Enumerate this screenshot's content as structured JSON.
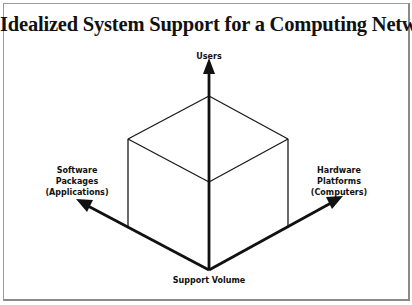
{
  "title": "Idealized System Support for a Computing Network",
  "axes": {
    "up": {
      "label": "Users"
    },
    "left": {
      "label_lines": [
        "Software",
        "Packages",
        "(Applications)"
      ]
    },
    "right": {
      "label_lines": [
        "Hardware",
        "Platforms",
        "(Computers)"
      ]
    },
    "bottom": {
      "label": "Support Volume"
    }
  },
  "colors": {
    "line": "#111111",
    "frame": "#9a9a9a",
    "background": "#ffffff"
  }
}
